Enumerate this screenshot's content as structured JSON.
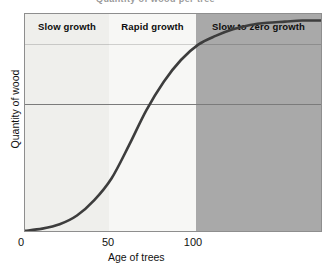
{
  "figure": {
    "title_fragment": "Quantity of wood per tree",
    "background": "#ffffff"
  },
  "axes": {
    "x": {
      "label": "Age of trees",
      "ticks": [
        "0",
        "50",
        "100"
      ],
      "tick_values": [
        0,
        50,
        100
      ],
      "range": [
        0,
        172
      ]
    },
    "y": {
      "label": "Quantity of wood",
      "ticks": [],
      "range": [
        0,
        100
      ]
    },
    "frame_color": "#8e8e8e",
    "gridline_color": "#7b7b7b"
  },
  "bands": [
    {
      "label": "Slow growth",
      "x_start": 0,
      "x_end": 48,
      "fill": "#efefec"
    },
    {
      "label": "Rapid growth",
      "x_start": 48,
      "x_end": 99,
      "fill": "#f7f7f5"
    },
    {
      "label": "Slow to zero growth",
      "x_start": 99,
      "x_end": 172,
      "fill": "#a9a9a9"
    }
  ],
  "chart_data": {
    "type": "line",
    "title": "Quantity of wood per tree",
    "xlabel": "Age of trees",
    "ylabel": "Quantity of wood",
    "xlim": [
      0,
      172
    ],
    "ylim": [
      0,
      100
    ],
    "xticks": [
      0,
      50,
      100
    ],
    "xticklabels": [
      "0",
      "50",
      "100"
    ],
    "yticks": [],
    "grid": "single horizontal gridline at y = 62",
    "legend": "none",
    "annotations": [
      "Slow growth",
      "Rapid growth",
      "Slow to zero growth"
    ],
    "series": [
      {
        "name": "Quantity of wood",
        "style": "sigmoid curve, dark grey, thick",
        "color": "#3d3d3d",
        "linewidth": 2.6,
        "x": [
          0,
          10,
          20,
          30,
          40,
          50,
          60,
          70,
          80,
          90,
          100,
          110,
          120,
          130,
          140,
          150,
          160,
          172
        ],
        "y": [
          1,
          2,
          4,
          8,
          15,
          25,
          40,
          56,
          69,
          79,
          86,
          90,
          93,
          95,
          96,
          96.5,
          97,
          97
        ]
      }
    ]
  }
}
